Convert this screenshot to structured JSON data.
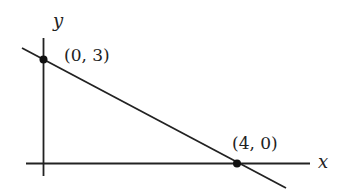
{
  "diagram": {
    "type": "coordinate-line-graph",
    "axes": {
      "x_label": "x",
      "y_label": "y"
    },
    "line": {
      "description": "Line through (0, 3) and (4, 0)",
      "color": "#222222"
    },
    "points": [
      {
        "label": "(0, 3)",
        "x": 0,
        "y": 3
      },
      {
        "label": "(4, 0)",
        "x": 4,
        "y": 0
      }
    ]
  }
}
